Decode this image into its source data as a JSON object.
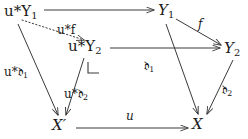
{
  "diagram": {
    "kind": "commutative-diagram",
    "stroke_color": "#3a3a3a",
    "text_color": "#1a1a1a",
    "background": "#ffffff",
    "nodes": [
      {
        "id": "u-star-Y1",
        "label": "u*Y₁",
        "base": "u*Y",
        "sub": "1",
        "x": 4,
        "y": 4
      },
      {
        "id": "Y1",
        "label": "Y₁",
        "base": "Y",
        "sub": "1",
        "x": 158,
        "y": 3
      },
      {
        "id": "u-star-Y2",
        "label": "u*Y₂",
        "base": "u*Y",
        "sub": "2",
        "x": 68,
        "y": 39
      },
      {
        "id": "Y2",
        "label": "Y₂",
        "base": "Y",
        "sub": "2",
        "x": 224,
        "y": 41
      },
      {
        "id": "X-prime",
        "label": "X′",
        "base": "X′",
        "sub": "",
        "x": 52,
        "y": 118
      },
      {
        "id": "X",
        "label": "X",
        "base": "X",
        "sub": "",
        "x": 192,
        "y": 117
      }
    ],
    "edge_labels": [
      {
        "id": "u-star-f",
        "label": "u*f",
        "base": "u*f",
        "sub": "",
        "x": 57,
        "y": 24
      },
      {
        "id": "f",
        "label": "f",
        "base": "f",
        "sub": "",
        "x": 198,
        "y": 18
      },
      {
        "id": "u-star-d1",
        "label": "u*∂₁",
        "base": "u*𝔡",
        "sub": "1",
        "x": 4,
        "y": 66
      },
      {
        "id": "u-star-d2",
        "label": "u*∂₂",
        "base": "u*𝔡",
        "sub": "2",
        "x": 64,
        "y": 88
      },
      {
        "id": "d1",
        "label": "∂₁",
        "base": "𝔡",
        "sub": "1",
        "x": 144,
        "y": 60
      },
      {
        "id": "d2",
        "label": "∂₂",
        "base": "𝔡",
        "sub": "2",
        "x": 222,
        "y": 84
      },
      {
        "id": "u",
        "label": "u",
        "base": "u",
        "sub": "",
        "x": 126,
        "y": 110
      }
    ],
    "corner_marker": {
      "id": "pullback-corner",
      "x": 88,
      "y": 62,
      "size": 11
    }
  }
}
